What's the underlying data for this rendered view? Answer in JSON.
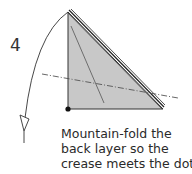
{
  "step": {
    "number": "4"
  },
  "caption": {
    "lines": [
      "Mountain-fold the",
      "back layer so the",
      "crease meets the dot."
    ]
  },
  "colors": {
    "paper_fill": "#c8c8c8",
    "line": "#222222",
    "dot": "#111111",
    "mountain_line": "#555555"
  }
}
